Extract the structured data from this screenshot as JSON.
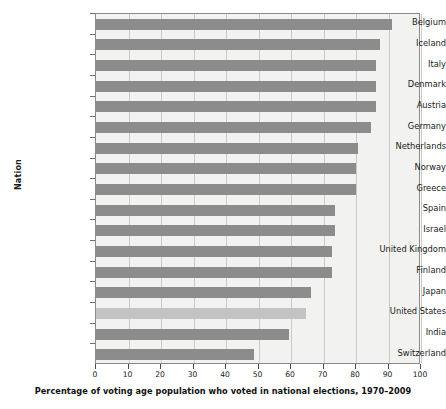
{
  "chart_data": {
    "type": "bar",
    "orientation": "horizontal",
    "title": "",
    "xlabel": "Percentage of voting age population who voted in national elections, 1970–2009",
    "ylabel": "Nation",
    "xlim": [
      0,
      100
    ],
    "xticks": [
      0,
      10,
      20,
      30,
      40,
      50,
      60,
      70,
      80,
      90,
      100
    ],
    "grid": true,
    "legend": "none",
    "categories": [
      "Belgium",
      "Iceland",
      "Italy",
      "Denmark",
      "Austria",
      "Germany",
      "Netherlands",
      "Norway",
      "Greece",
      "Spain",
      "Israel",
      "United Kingdom",
      "Finland",
      "Japan",
      "United States",
      "India",
      "Switzerland"
    ],
    "values": [
      91,
      87.5,
      86,
      86,
      86,
      84.5,
      80.5,
      80,
      80,
      73.5,
      73.5,
      72.5,
      72.5,
      66,
      64.5,
      59.5,
      48.5
    ],
    "highlighted_category": "United States",
    "colors": {
      "bar": "#8c8c8c",
      "bar_highlight": "#c3c3c3",
      "plot_background": "#f2f2f0",
      "gridline": "#c9c9c6",
      "axis": "#8a8a8a",
      "text": "#1a1a1a"
    }
  }
}
